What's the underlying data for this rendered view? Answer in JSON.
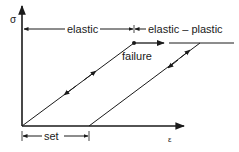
{
  "diagram": {
    "title": "",
    "axes": {
      "y_label": "σ",
      "x_label": "ε"
    },
    "regions": {
      "elastic_label": "elastic",
      "elastic_plastic_label": "elastic – plastic"
    },
    "annotations": {
      "failure_label": "failure",
      "set_label": "set"
    },
    "colors": {
      "line": "#1a1a1a",
      "background": "#ffffff"
    }
  }
}
